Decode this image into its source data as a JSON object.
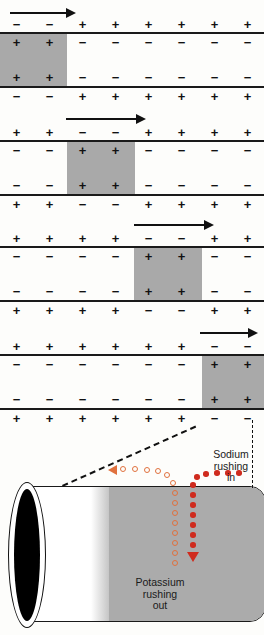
{
  "figure": {
    "background_color": "#fdfdfb",
    "shade_color": "#a9a9a9",
    "sign_plus": "+",
    "sign_minus": "−",
    "columns": 8
  },
  "panels": [
    {
      "id": "panel-1",
      "arrow": {
        "label": "propagation-arrow",
        "left": 10,
        "top": 6,
        "width": 66
      },
      "depolarized_columns": [
        1,
        2
      ],
      "outer_top": [
        "−",
        "−",
        "+",
        "+",
        "+",
        "+",
        "+",
        "+"
      ],
      "inner_top": [
        "+",
        "+",
        "−",
        "−",
        "−",
        "−",
        "−",
        "−"
      ],
      "inner_bot": [
        "+",
        "+",
        "−",
        "−",
        "−",
        "−",
        "−",
        "−"
      ],
      "outer_bot": [
        "−",
        "−",
        "+",
        "+",
        "+",
        "+",
        "+",
        "+"
      ]
    },
    {
      "id": "panel-2",
      "arrow": {
        "label": "propagation-arrow",
        "left": 66,
        "top": 112,
        "width": 80
      },
      "depolarized_columns": [
        3,
        4
      ],
      "outer_top": [
        "+",
        "+",
        "−",
        "−",
        "+",
        "+",
        "+",
        "+"
      ],
      "inner_top": [
        "−",
        "−",
        "+",
        "+",
        "−",
        "−",
        "−",
        "−"
      ],
      "inner_bot": [
        "−",
        "−",
        "+",
        "+",
        "−",
        "−",
        "−",
        "−"
      ],
      "outer_bot": [
        "+",
        "+",
        "−",
        "−",
        "+",
        "+",
        "+",
        "+"
      ]
    },
    {
      "id": "panel-3",
      "arrow": {
        "label": "propagation-arrow",
        "left": 134,
        "top": 218,
        "width": 80
      },
      "depolarized_columns": [
        5,
        6
      ],
      "outer_top": [
        "+",
        "+",
        "+",
        "+",
        "−",
        "−",
        "+",
        "+"
      ],
      "inner_top": [
        "−",
        "−",
        "−",
        "−",
        "+",
        "+",
        "−",
        "−"
      ],
      "inner_bot": [
        "−",
        "−",
        "−",
        "−",
        "+",
        "+",
        "−",
        "−"
      ],
      "outer_bot": [
        "+",
        "+",
        "+",
        "+",
        "−",
        "−",
        "+",
        "+"
      ]
    },
    {
      "id": "panel-4",
      "arrow": {
        "label": "propagation-arrow",
        "left": 200,
        "top": 326,
        "width": 58
      },
      "depolarized_columns": [
        7,
        8
      ],
      "outer_top": [
        "+",
        "+",
        "+",
        "+",
        "+",
        "+",
        "−",
        "−"
      ],
      "inner_top": [
        "−",
        "−",
        "−",
        "−",
        "−",
        "−",
        "+",
        "+"
      ],
      "inner_bot": [
        "−",
        "−",
        "−",
        "−",
        "−",
        "−",
        "+",
        "+"
      ],
      "outer_bot": [
        "+",
        "+",
        "+",
        "+",
        "+",
        "+",
        "−",
        "−"
      ]
    }
  ],
  "axon": {
    "name": "axon-tube",
    "sodium_label": "Sodium rushing in",
    "sodium_label_lines": [
      "Sodium",
      "rushing",
      "in"
    ],
    "sodium_color": "#cf2b1e",
    "potassium_label": "Potassium rushing out",
    "potassium_label_lines": [
      "Potassium",
      "rushing",
      "out"
    ],
    "potassium_color": "#e0713e"
  }
}
